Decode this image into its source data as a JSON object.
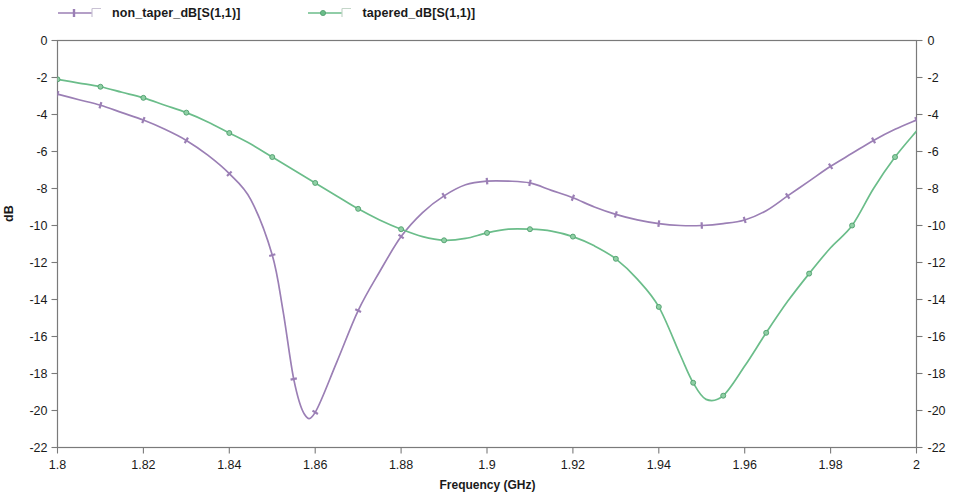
{
  "chart_data": {
    "type": "line",
    "title": "",
    "xlabel": "Frequency (GHz)",
    "ylabel": "dB",
    "xlim": [
      1.8,
      2.0
    ],
    "ylim": [
      -22,
      0
    ],
    "xticks": [
      "1.8",
      "1.82",
      "1.84",
      "1.86",
      "1.88",
      "1.9",
      "1.92",
      "1.94",
      "1.96",
      "1.98",
      "2"
    ],
    "xtick_values": [
      1.8,
      1.82,
      1.84,
      1.86,
      1.88,
      1.9,
      1.92,
      1.94,
      1.96,
      1.98,
      2.0
    ],
    "yticks": [
      "0",
      "-2",
      "-4",
      "-6",
      "-8",
      "-10",
      "-12",
      "-14",
      "-16",
      "-18",
      "-20",
      "-22"
    ],
    "ytick_values": [
      0,
      -2,
      -4,
      -6,
      -8,
      -10,
      -12,
      -14,
      -16,
      -18,
      -20,
      -22
    ],
    "y2ticks": [
      "0",
      "-2",
      "-4",
      "-6",
      "-8",
      "-10",
      "-12",
      "-14",
      "-16",
      "-18",
      "-20",
      "-22"
    ],
    "grid": false,
    "legend_position": "above-plot",
    "series": [
      {
        "name": "non_taper_dB[S(1,1)]",
        "color": "#9b7fb5",
        "marker": "tick",
        "x": [
          1.8,
          1.805,
          1.81,
          1.815,
          1.82,
          1.825,
          1.83,
          1.835,
          1.84,
          1.845,
          1.85,
          1.8525,
          1.855,
          1.8575,
          1.86,
          1.865,
          1.87,
          1.875,
          1.88,
          1.885,
          1.89,
          1.895,
          1.9,
          1.905,
          1.91,
          1.915,
          1.92,
          1.925,
          1.93,
          1.935,
          1.94,
          1.945,
          1.95,
          1.955,
          1.96,
          1.965,
          1.97,
          1.975,
          1.98,
          1.985,
          1.99,
          1.995,
          2.0
        ],
        "y": [
          -2.9,
          -3.2,
          -3.5,
          -3.9,
          -4.3,
          -4.8,
          -5.4,
          -6.2,
          -7.2,
          -8.6,
          -11.6,
          -14.6,
          -18.3,
          -20.2,
          -20.1,
          -17.4,
          -14.6,
          -12.5,
          -10.6,
          -9.3,
          -8.4,
          -7.8,
          -7.6,
          -7.6,
          -7.7,
          -8.1,
          -8.5,
          -9.0,
          -9.4,
          -9.7,
          -9.9,
          -10.0,
          -10.0,
          -9.9,
          -9.7,
          -9.2,
          -8.4,
          -7.6,
          -6.8,
          -6.1,
          -5.4,
          -4.8,
          -4.3
        ],
        "min_value": -20.3,
        "min_at": 1.8555
      },
      {
        "name": "tapered_dB[S(1,1)]",
        "color": "#6bbd8a",
        "marker": "circle",
        "x": [
          1.8,
          1.805,
          1.81,
          1.815,
          1.82,
          1.825,
          1.83,
          1.835,
          1.84,
          1.845,
          1.85,
          1.855,
          1.86,
          1.865,
          1.87,
          1.875,
          1.88,
          1.885,
          1.89,
          1.895,
          1.9,
          1.905,
          1.91,
          1.915,
          1.92,
          1.925,
          1.93,
          1.935,
          1.94,
          1.945,
          1.948,
          1.951,
          1.955,
          1.96,
          1.965,
          1.97,
          1.975,
          1.98,
          1.985,
          1.99,
          1.995,
          2.0
        ],
        "y": [
          -2.1,
          -2.3,
          -2.5,
          -2.8,
          -3.1,
          -3.5,
          -3.9,
          -4.4,
          -5.0,
          -5.6,
          -6.3,
          -7.0,
          -7.7,
          -8.4,
          -9.1,
          -9.7,
          -10.2,
          -10.6,
          -10.8,
          -10.7,
          -10.4,
          -10.2,
          -10.2,
          -10.3,
          -10.6,
          -11.1,
          -11.8,
          -12.9,
          -14.4,
          -17.0,
          -18.5,
          -19.4,
          -19.2,
          -17.6,
          -15.8,
          -14.1,
          -12.6,
          -11.2,
          -10.0,
          -8.0,
          -6.3,
          -4.9
        ],
        "min_value": -19.5,
        "min_at": 1.9505
      }
    ],
    "annotations": {
      "crossover_freq_ghz": 1.88,
      "crossover_db": -10.2
    }
  },
  "legend": {
    "entries": [
      {
        "label": "non_taper_dB[S(1,1)]"
      },
      {
        "label": "tapered_dB[S(1,1)]"
      }
    ]
  }
}
